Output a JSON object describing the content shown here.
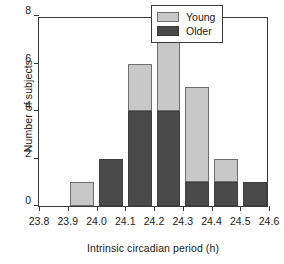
{
  "chart_data": {
    "type": "bar",
    "title": "",
    "subtitle": "",
    "xlabel": "Intrinsic circadian period (h)",
    "ylabel": "Number of subjects",
    "stacked": true,
    "grid": false,
    "legend_position": "top-right",
    "xlim": [
      23.8,
      24.6
    ],
    "ylim": [
      0,
      8
    ],
    "xticks": [
      "23.8",
      "23.9",
      "24.0",
      "24.1",
      "24.2",
      "24.3",
      "24.4",
      "24.5",
      "24.6"
    ],
    "xtick_values": [
      23.8,
      23.9,
      24.0,
      24.1,
      24.2,
      24.3,
      24.4,
      24.5,
      24.6
    ],
    "yticks": [
      "0",
      "2",
      "4",
      "6",
      "8"
    ],
    "ytick_values": [
      0,
      2,
      4,
      6,
      8
    ],
    "bin_width": 0.1,
    "bins": [
      {
        "start": 23.8,
        "end": 23.9,
        "older": 0,
        "young": 0,
        "total": 0
      },
      {
        "start": 23.9,
        "end": 24.0,
        "older": 0,
        "young": 1,
        "total": 1
      },
      {
        "start": 24.0,
        "end": 24.1,
        "older": 2,
        "young": 0,
        "total": 2
      },
      {
        "start": 24.1,
        "end": 24.2,
        "older": 4,
        "young": 2,
        "total": 6
      },
      {
        "start": 24.2,
        "end": 24.3,
        "older": 4,
        "young": 3,
        "total": 7
      },
      {
        "start": 24.3,
        "end": 24.4,
        "older": 1,
        "young": 4,
        "total": 5
      },
      {
        "start": 24.4,
        "end": 24.5,
        "older": 1,
        "young": 1,
        "total": 2
      },
      {
        "start": 24.5,
        "end": 24.6,
        "older": 1,
        "young": 0,
        "total": 1
      }
    ],
    "series": [
      {
        "name": "Young",
        "color": "#c8c8c8",
        "values": [
          0,
          1,
          0,
          2,
          3,
          4,
          1,
          0
        ]
      },
      {
        "name": "Older",
        "color": "#4a4a4a",
        "values": [
          0,
          0,
          2,
          4,
          4,
          1,
          1,
          1
        ]
      }
    ],
    "legend": [
      {
        "label": "Young",
        "color": "#c8c8c8",
        "swatch": "legend-swatch-young"
      },
      {
        "label": "Older",
        "color": "#4a4a4a",
        "swatch": "legend-swatch-older"
      }
    ],
    "colors": {
      "young": "#c8c8c8",
      "older": "#4a4a4a",
      "axis": "#3a3a3a",
      "text": "#1a1a1a",
      "background": "#ffffff"
    }
  }
}
